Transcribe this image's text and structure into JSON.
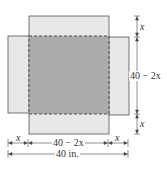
{
  "diagram": {
    "type": "open-box net",
    "colors": {
      "flap_fill": "#e8e8e8",
      "base_fill": "#ababab",
      "stroke": "#555555",
      "text": "#333333"
    },
    "labels": {
      "top_flap_height": "x",
      "base_side_vertical": "40 − 2x",
      "bottom_flap_height": "x",
      "left_flap_width": "x",
      "base_side_horizontal": "40 − 2x",
      "right_flap_width": "x",
      "total_width": "40 in."
    }
  }
}
